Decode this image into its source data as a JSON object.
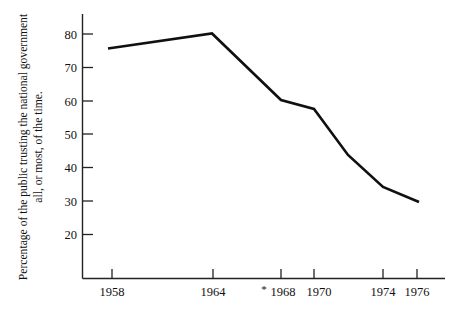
{
  "chart_data": {
    "type": "line",
    "title": "",
    "xlabel": "",
    "ylabel": "Percentage of the public trusting the national government all, or most, of the time.",
    "ylabel_line1": "Percentage of the public trusting the national government",
    "ylabel_line2": "all, or most, of the time.",
    "x": [
      1958,
      1964,
      1968,
      1970,
      1972,
      1974,
      1976
    ],
    "values": [
      75.5,
      80,
      70,
      58,
      45,
      35,
      30
    ],
    "x_tick_labels": [
      "1958",
      "1964",
      "1968",
      "1970",
      "1974",
      "1976"
    ],
    "x_tick_values": [
      1958,
      1964,
      1968,
      1970,
      1974,
      1976
    ],
    "y_tick_labels": [
      "80",
      "70",
      "60",
      "50",
      "40",
      "30",
      "20"
    ],
    "y_tick_values": [
      80,
      70,
      60,
      50,
      40,
      30,
      20
    ],
    "xlim": [
      1956,
      1978
    ],
    "ylim": [
      14,
      84
    ],
    "grid": false,
    "legend": "none",
    "annotations": [
      {
        "text": "*",
        "near": "1968",
        "meaning": "footnote-marker-before-1968-label"
      }
    ],
    "line_color": "#101010",
    "axis_color": "#222222"
  },
  "axis": {
    "y_title_line1": "Percentage of the public trusting the national government",
    "y_title_line2": "all, or most, of the time.",
    "footnote_asterisk": "*"
  },
  "ticks": {
    "y": [
      {
        "label": "80",
        "y": 34
      },
      {
        "label": "70",
        "y": 67.5
      },
      {
        "label": "60",
        "y": 101
      },
      {
        "label": "50",
        "y": 134
      },
      {
        "label": "40",
        "y": 167.5
      },
      {
        "label": "30",
        "y": 201
      },
      {
        "label": "20",
        "y": 234.5
      }
    ],
    "x": [
      {
        "label": "1958",
        "x": 112
      },
      {
        "label": "1964",
        "x": 213
      },
      {
        "label": "1968",
        "x": 281
      },
      {
        "label": "1970",
        "x": 314
      },
      {
        "label": "1974",
        "x": 383
      },
      {
        "label": "1976",
        "x": 417
      }
    ]
  },
  "series_points": [
    {
      "x": 108,
      "y": 48.5,
      "year": 1958,
      "value": 75.5
    },
    {
      "x": 212,
      "y": 33.5,
      "year": 1964,
      "value": 80
    },
    {
      "x": 281,
      "y": 100,
      "year": 1968,
      "value": 70
    },
    {
      "x": 314,
      "y": 109,
      "year": 1970,
      "value": 58
    },
    {
      "x": 348,
      "y": 155,
      "year": 1972,
      "value": 45
    },
    {
      "x": 383,
      "y": 187,
      "year": 1974,
      "value": 35
    },
    {
      "x": 419,
      "y": 202,
      "year": 1976,
      "value": 30
    }
  ]
}
